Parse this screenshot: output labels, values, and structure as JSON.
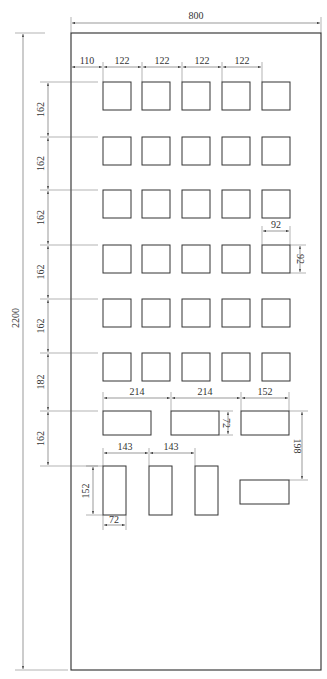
{
  "drawing": {
    "title": "Panel cutout layout",
    "panel": {
      "x": 71,
      "y": 33,
      "w": 250,
      "h": 637
    },
    "overall": {
      "width_label": "800",
      "height_label": "2200"
    },
    "square_grid": {
      "size_label": "92",
      "offset_label": "110",
      "col_pitch_label": "122",
      "col_x": [
        103,
        142,
        182,
        222,
        262
      ],
      "row_y": [
        82,
        137,
        190,
        245,
        299,
        353
      ],
      "size_px": 28
    },
    "row_pitch_labels": [
      "162",
      "162",
      "162",
      "162",
      "162",
      "182",
      "162"
    ],
    "row_pitch_y": [
      33,
      82,
      137,
      190,
      245,
      299,
      353,
      411,
      466
    ],
    "wide_cutouts": {
      "labels": [
        "214",
        "214",
        "152"
      ],
      "height_label": "72",
      "rects": [
        {
          "x": 103,
          "y": 411,
          "w": 48,
          "h": 24
        },
        {
          "x": 171,
          "y": 411,
          "w": 48,
          "h": 24
        },
        {
          "x": 241,
          "y": 411,
          "w": 48,
          "h": 24
        }
      ]
    },
    "tall_cutouts": {
      "pitch_labels": [
        "143",
        "143"
      ],
      "height_label": "152",
      "width_label": "72",
      "rects": [
        {
          "x": 103,
          "y": 466,
          "w": 23,
          "h": 49
        },
        {
          "x": 149,
          "y": 466,
          "w": 23,
          "h": 49
        },
        {
          "x": 195,
          "y": 466,
          "w": 23,
          "h": 49
        }
      ]
    },
    "side_cutout": {
      "offset_label": "198",
      "rect": {
        "x": 240,
        "y": 480,
        "w": 49,
        "h": 24
      }
    }
  }
}
